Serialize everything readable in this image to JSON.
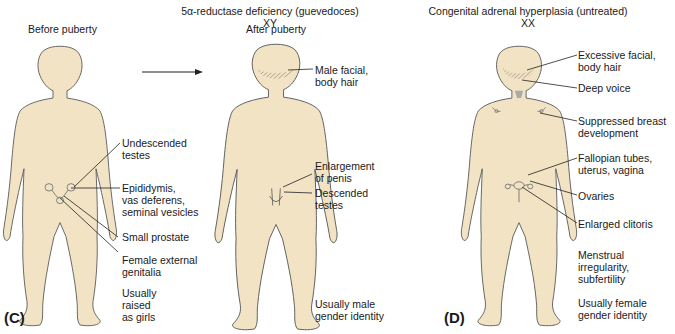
{
  "titles": {
    "c_title": "5α-reductase deficiency (guevedoces)",
    "c_karyotype": "XY",
    "d_title": "Congenital adrenal hyperplasia (untreated)",
    "d_karyotype": "XX"
  },
  "panel_c": {
    "label": "(C)",
    "before_heading": "Before puberty",
    "after_heading": "After puberty",
    "before_labels": [
      "Undescended\ntestes",
      "Epididymis,\nvas deferens,\nseminal vesicles",
      "Small prostate",
      "Female external\ngenitalia",
      "Usually\nraised\nas girls"
    ],
    "after_labels": [
      "Male facial,\nbody hair",
      "Enlargement\nof penis",
      "Descended\ntestes",
      "Usually male\ngender identity"
    ]
  },
  "panel_d": {
    "label": "(D)",
    "labels": [
      "Excessive facial,\nbody hair",
      "Deep voice",
      "Suppressed breast\ndevelopment",
      "Fallopian tubes,\nuterus, vagina",
      "Ovaries",
      "Enlarged clitoris",
      "Menstrual\nirregularity,\nsubfertility",
      "Usually female\ngender identity"
    ]
  },
  "colors": {
    "skin": "#f1e3c4",
    "outline": "#555555",
    "text": "#1a1a1a"
  }
}
